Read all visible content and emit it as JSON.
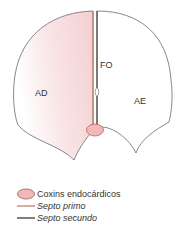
{
  "labels": {
    "right_atrium": "AD",
    "left_atrium": "AE",
    "foramen_ovale": "FO"
  },
  "legend": [
    {
      "label": "Coxins endocárdicos",
      "swatch": "ellipse",
      "color": "#f2b8b8",
      "italic": false
    },
    {
      "label": "Septo primo",
      "swatch": "line",
      "color": "#c98a7a",
      "italic": true
    },
    {
      "label": "Septo secundo",
      "swatch": "line",
      "color": "#4a4a40",
      "italic": true
    }
  ],
  "colors": {
    "outline": "#6b6b6b",
    "right_atrium_fill": "#f7d9da",
    "cushion_fill": "#f2b8b8",
    "cushion_stroke": "#a05a55",
    "septum_primum": "#c98a7a",
    "septum_secundum": "#3d3d35"
  }
}
